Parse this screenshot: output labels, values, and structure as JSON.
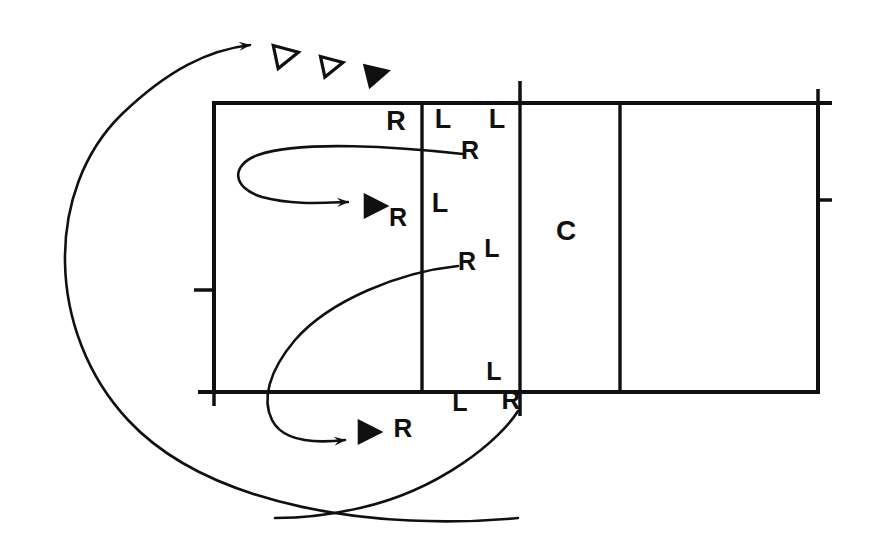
{
  "figure": {
    "type": "schematic-diagram",
    "background_color": "#ffffff",
    "ink_color": "#101010",
    "width": 869,
    "height": 559
  },
  "box": {
    "name": "main-rectangle",
    "left": 214,
    "top": 103,
    "right": 818,
    "bottom": 392,
    "stroke_width": 4,
    "dividers_x": [
      422,
      520,
      620
    ],
    "ticks": [
      {
        "name": "tick-top-center",
        "side": "top",
        "x": 520,
        "length": 22
      },
      {
        "name": "tick-top-right",
        "side": "top",
        "x": 818,
        "length": 14
      },
      {
        "name": "tick-left-middle",
        "side": "left",
        "y": 290,
        "length": 20
      },
      {
        "name": "tick-right-middle",
        "side": "right",
        "y": 200,
        "length": 14
      },
      {
        "name": "tick-bottom-left",
        "side": "bottom",
        "x": 214,
        "length": 14
      },
      {
        "name": "tick-bottom-center",
        "side": "bottom",
        "x": 520,
        "length": 24
      }
    ]
  },
  "labels": [
    {
      "id": "label-r-1",
      "text": "R",
      "x": 396,
      "y": 130,
      "size": 27
    },
    {
      "id": "label-l-1",
      "text": "L",
      "x": 443,
      "y": 128,
      "size": 27
    },
    {
      "id": "label-l-2",
      "text": "L",
      "x": 497,
      "y": 128,
      "size": 27
    },
    {
      "id": "label-r-2",
      "text": "R",
      "x": 470,
      "y": 159,
      "size": 25
    },
    {
      "id": "label-l-3",
      "text": "L",
      "x": 440,
      "y": 212,
      "size": 27
    },
    {
      "id": "label-r-3",
      "text": "R",
      "x": 398,
      "y": 226,
      "size": 25
    },
    {
      "id": "label-l-4",
      "text": "L",
      "x": 492,
      "y": 257,
      "size": 25
    },
    {
      "id": "label-r-4",
      "text": "R",
      "x": 467,
      "y": 270,
      "size": 25
    },
    {
      "id": "label-c",
      "text": "C",
      "x": 566,
      "y": 240,
      "size": 28
    },
    {
      "id": "label-l-5",
      "text": "L",
      "x": 494,
      "y": 380,
      "size": 25
    },
    {
      "id": "label-l-6",
      "text": "L",
      "x": 460,
      "y": 411,
      "size": 25
    },
    {
      "id": "label-r-5",
      "text": "R",
      "x": 511,
      "y": 409,
      "size": 26
    },
    {
      "id": "label-r-6",
      "text": "R",
      "x": 403,
      "y": 437,
      "size": 26
    }
  ],
  "triangles": [
    {
      "id": "triangle-outline-1",
      "x": 285,
      "y": 55,
      "size": 19,
      "filled": false,
      "rotation": -12
    },
    {
      "id": "triangle-outline-2",
      "x": 331,
      "y": 65,
      "size": 17,
      "filled": false,
      "rotation": -12
    },
    {
      "id": "triangle-filled-1",
      "x": 376,
      "y": 74,
      "size": 19,
      "filled": true,
      "rotation": -14
    },
    {
      "id": "triangle-filled-2",
      "x": 374,
      "y": 206,
      "size": 19,
      "filled": true,
      "rotation": 0
    },
    {
      "id": "triangle-filled-3",
      "x": 368,
      "y": 432,
      "size": 19,
      "filled": true,
      "rotation": 0
    }
  ],
  "curves": [
    {
      "id": "curve-outer-recycle",
      "description": "Large arc sweeping from bottom-right around the left side up to top, with arrowhead pointing right",
      "arrowhead": "end",
      "path": "M 518 518 C 380 531 210 508 128 420 C 46 332 44 190 122 114 C 168 70 208 50 250 45"
    },
    {
      "id": "curve-inner-loop-upper",
      "description": "Hairpin loop inside the first cell ending with arrow pointing right",
      "arrowhead": "end",
      "path": "M 463 154 C 400 147 300 140 258 155 C 230 165 232 188 262 197 C 292 205 320 203 348 202"
    },
    {
      "id": "curve-lower-sweep",
      "description": "Arc from label R-4 sweeping left and down, ending with arrow pointing right below the box",
      "arrowhead": "end",
      "path": "M 458 266 C 400 272 330 300 295 340 C 268 372 262 400 272 420 C 282 440 310 444 345 440"
    },
    {
      "id": "curve-bottom-right-tail",
      "description": "Tail curve descending from the R label at the box bottom edge toward the lower-left",
      "arrowhead": "none",
      "path": "M 518 411 C 500 440 440 490 360 508 C 330 515 300 518 275 518"
    }
  ],
  "legend_text": {
    "r": "R",
    "l": "L",
    "c": "C"
  }
}
